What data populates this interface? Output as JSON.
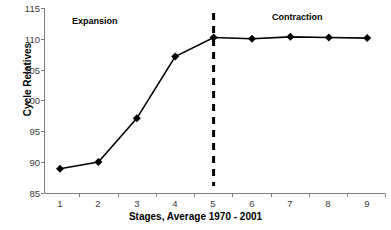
{
  "chart_data": {
    "type": "line",
    "title": "",
    "xlabel": "Stages, Average 1970 - 2001",
    "ylabel": "Cycle Relatives",
    "categories": [
      "1",
      "2",
      "3",
      "4",
      "5",
      "6",
      "7",
      "8",
      "9"
    ],
    "x": [
      1,
      2,
      3,
      4,
      5,
      6,
      7,
      8,
      9
    ],
    "values": [
      89.0,
      90.1,
      97.2,
      107.2,
      110.3,
      110.1,
      110.4,
      110.3,
      110.2
    ],
    "series": [
      {
        "name": "Cycle Relatives",
        "values": [
          89.0,
          90.1,
          97.2,
          107.2,
          110.3,
          110.1,
          110.4,
          110.3,
          110.2
        ],
        "marker": "diamond",
        "color": "#000000"
      }
    ],
    "ylim": [
      85,
      115
    ],
    "yticks": [
      85,
      90,
      95,
      100,
      105,
      110,
      115
    ],
    "ytick_labels": [
      "85",
      "90",
      "95",
      "100",
      "105",
      "110",
      "115"
    ],
    "xticks": [
      1,
      2,
      3,
      4,
      5,
      6,
      7,
      8,
      9
    ],
    "xtick_labels": [
      "1",
      "2",
      "3",
      "4",
      "5",
      "6",
      "7",
      "8",
      "9"
    ],
    "grid": false,
    "legend": null,
    "legend_position": "none",
    "annotations": [
      {
        "text": "Expansion",
        "x": 2.3,
        "y": 114.0
      },
      {
        "text": "Contraction",
        "x": 7.5,
        "y": 114.5
      }
    ],
    "reference_lines": [
      {
        "orientation": "vertical",
        "x": 5,
        "style": "dashed",
        "color": "#000000"
      }
    ],
    "axis_color": "#808080",
    "line_color": "#000000",
    "background": "#ffffff"
  }
}
